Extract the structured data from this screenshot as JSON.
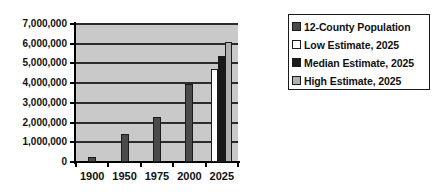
{
  "chart_data": {
    "type": "bar",
    "title": "",
    "xlabel": "",
    "ylabel": "",
    "categories": [
      "1900",
      "1950",
      "1975",
      "2000",
      "2025"
    ],
    "ylim": [
      0,
      7000000
    ],
    "ytick_labels": [
      "7,000,000",
      "6,000,000",
      "5,000,000",
      "4,000,000",
      "3,000,000",
      "2,000,000",
      "1,000,000",
      "0"
    ],
    "ytick_values": [
      7000000,
      6000000,
      5000000,
      4000000,
      3000000,
      2000000,
      1000000,
      0
    ],
    "ytick_interval": 1000000,
    "grid": true,
    "legend_position": "right",
    "series": [
      {
        "name": "12-County Population",
        "color": "#4a4a4a",
        "values": [
          250000,
          1400000,
          2300000,
          3980000,
          null
        ]
      },
      {
        "name": "Low Estimate, 2025",
        "color": "#ffffff",
        "values": [
          null,
          null,
          null,
          null,
          4700000
        ]
      },
      {
        "name": "Median Estimate, 2025",
        "color": "#1a1a1a",
        "values": [
          null,
          null,
          null,
          null,
          5400000
        ]
      },
      {
        "name": "High Estimate, 2025",
        "color": "#b0b0b0",
        "values": [
          null,
          null,
          null,
          null,
          6100000
        ]
      }
    ]
  },
  "legend": {
    "items": [
      {
        "label": "12-County Population",
        "color": "#4a4a4a"
      },
      {
        "label": "Low Estimate, 2025",
        "color": "#ffffff"
      },
      {
        "label": "Median Estimate, 2025",
        "color": "#1a1a1a"
      },
      {
        "label": "High Estimate, 2025",
        "color": "#b0b0b0"
      }
    ]
  },
  "plot": {
    "background_color": "#c9c9c9",
    "gridline_color": "#2b2b2b",
    "axis_color": "#000000"
  }
}
